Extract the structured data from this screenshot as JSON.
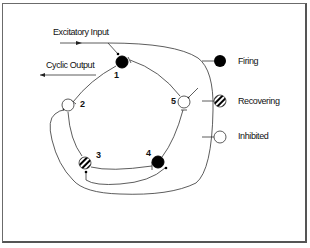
{
  "diagram": {
    "input_label": "Excitatory Input",
    "output_label": "Cyclic Output",
    "nodes": [
      {
        "id": "1",
        "state": "firing"
      },
      {
        "id": "2",
        "state": "inhibited"
      },
      {
        "id": "3",
        "state": "recovering"
      },
      {
        "id": "4",
        "state": "firing"
      },
      {
        "id": "5",
        "state": "inhibited"
      }
    ]
  },
  "legend": {
    "items": [
      {
        "label": "Firing",
        "icon": "filled-circle-icon"
      },
      {
        "label": "Recovering",
        "icon": "striped-circle-icon"
      },
      {
        "label": "Inhibited",
        "icon": "open-circle-icon"
      }
    ]
  },
  "colors": {
    "line": "#333333",
    "fill": "#000000",
    "border": "#6b6b6b"
  }
}
